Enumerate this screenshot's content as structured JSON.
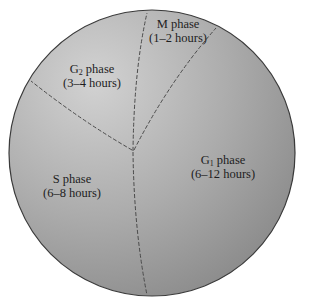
{
  "diagram": {
    "type": "cell-cycle-pie",
    "colors": {
      "fill_light": "#c9c9c9",
      "fill_dark": "#8c8c8c",
      "outline": "#3a3a3a",
      "divider": "#4a4a4a",
      "text": "#1e1e1e"
    },
    "phases": [
      {
        "name": "M",
        "sub": "",
        "label_suffix": "phase",
        "duration": "(1–2 hours)"
      },
      {
        "name": "G",
        "sub": "2",
        "label_suffix": "phase",
        "duration": "(3–4 hours)"
      },
      {
        "name": "S",
        "sub": "",
        "label_suffix": "phase",
        "duration": "(6–8 hours)"
      },
      {
        "name": "G",
        "sub": "1",
        "label_suffix": "phase",
        "duration": "(6–12 hours)"
      }
    ]
  }
}
